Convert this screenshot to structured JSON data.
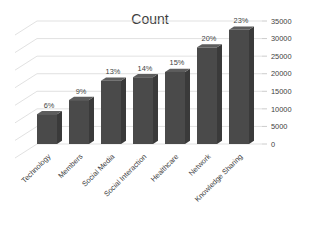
{
  "chart_data": {
    "type": "bar",
    "title": "Count",
    "xlabel": "",
    "ylabel": "",
    "categories": [
      "Technology",
      "Members",
      "Social Media",
      "Social Interaction",
      "Healthcare",
      "Network",
      "Knowledge Sharing"
    ],
    "values": [
      8500,
      12500,
      18000,
      19000,
      20500,
      27500,
      32500
    ],
    "data_labels": [
      "6%",
      "9%",
      "13%",
      "14%",
      "15%",
      "20%",
      "23%"
    ],
    "ylim": [
      0,
      35000
    ],
    "ytick_labels": [
      "0",
      "5000",
      "10000",
      "15000",
      "20000",
      "25000",
      "30000",
      "35000"
    ],
    "ytick_values": [
      0,
      5000,
      10000,
      15000,
      20000,
      25000,
      30000,
      35000
    ],
    "grid": true,
    "legend": "none",
    "style": "3d-column",
    "bar_color": "#4a4a4a",
    "bar_side_color": "#3a3a3a",
    "bar_top_color": "#5d5d5d",
    "grid_color": "#d9d9d9",
    "text_color": "#3f3f3f",
    "background": "#ffffff",
    "category_label_rotation": -45
  }
}
